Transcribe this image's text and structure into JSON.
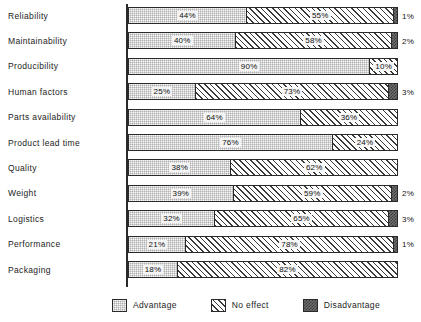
{
  "chart_data": {
    "type": "bar",
    "subtype": "stacked-horizontal-100pct",
    "title": "",
    "xlabel": "",
    "ylabel": "",
    "xlim": [
      0,
      100
    ],
    "grid": false,
    "legend_position": "bottom",
    "categories": [
      "Reliability",
      "Maintainability",
      "Producibility",
      "Human factors",
      "Parts availability",
      "Product lead time",
      "Quality",
      "Weight",
      "Logistics",
      "Performance",
      "Packaging"
    ],
    "series": [
      {
        "name": "Advantage",
        "color": "#d2d2d2",
        "pattern": "stipple",
        "values": [
          44,
          40,
          90,
          25,
          64,
          76,
          38,
          39,
          32,
          21,
          18
        ],
        "labels": [
          "44%",
          "40%",
          "90%",
          "25%",
          "64%",
          "76%",
          "38%",
          "39%",
          "32%",
          "21%",
          "18%"
        ]
      },
      {
        "name": "No effect",
        "color": "#ffffff",
        "pattern": "diagonal-hatch",
        "values": [
          55,
          58,
          10,
          73,
          36,
          24,
          62,
          59,
          65,
          78,
          82
        ],
        "labels": [
          "55%",
          "58%",
          "10%",
          "73%",
          "36%",
          "24%",
          "62%",
          "59%",
          "65%",
          "78%",
          "82%"
        ]
      },
      {
        "name": "Disadvantage",
        "color": "#6e6e6e",
        "pattern": "checker",
        "values": [
          1,
          2,
          0,
          3,
          0,
          0,
          0,
          2,
          3,
          1,
          0
        ],
        "labels": [
          "1%",
          "2%",
          "",
          "3%",
          "",
          "",
          "",
          "2%",
          "3%",
          "1%",
          ""
        ]
      }
    ]
  },
  "legend": {
    "items": [
      {
        "label": "Advantage"
      },
      {
        "label": "No effect"
      },
      {
        "label": "Disadvantage"
      }
    ]
  }
}
